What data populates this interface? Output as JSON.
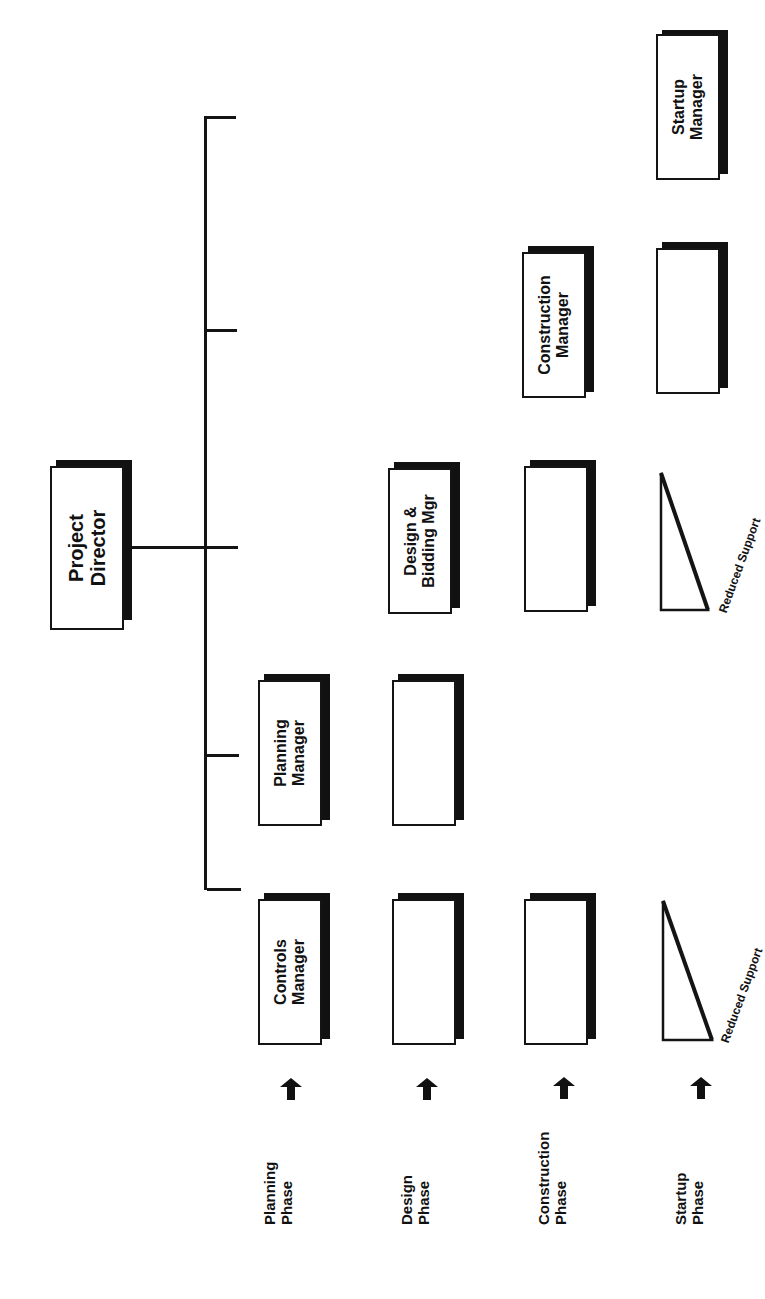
{
  "diagram": {
    "type": "org-chart",
    "orientation": "rotated-90-ccw",
    "root": {
      "line1": "Project",
      "line2": "Director"
    },
    "managers": [
      {
        "id": "controls",
        "line1": "Controls",
        "line2": "Manager"
      },
      {
        "id": "planning",
        "line1": "Planning",
        "line2": "Manager"
      },
      {
        "id": "design",
        "line1": "Design &",
        "line2": "Bidding Mgr"
      },
      {
        "id": "construction",
        "line1": "Construction",
        "line2": "Manager"
      },
      {
        "id": "startup",
        "line1": "Startup",
        "line2": "Manager"
      }
    ],
    "phases": [
      {
        "line1": "Planning",
        "line2": "Phase"
      },
      {
        "line1": "Design",
        "line2": "Phase"
      },
      {
        "line1": "Construction",
        "line2": "Phase"
      },
      {
        "line1": "Startup",
        "line2": "Phase"
      }
    ],
    "reduced_support_label": "Reduced Support",
    "colors": {
      "ink": "#141414",
      "background": "#ffffff"
    }
  }
}
